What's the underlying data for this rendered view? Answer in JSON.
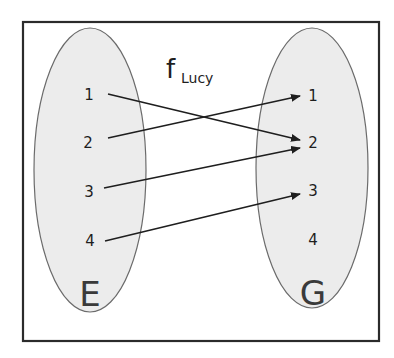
{
  "diagram": {
    "type": "function-mapping",
    "function": {
      "name": "f",
      "subscript": "Lucy"
    },
    "domain": {
      "label": "E",
      "elements": [
        "1",
        "2",
        "3",
        "4"
      ]
    },
    "codomain": {
      "label": "G",
      "elements": [
        "1",
        "2",
        "3",
        "4"
      ]
    },
    "mappings": [
      {
        "from": "1",
        "to": "2"
      },
      {
        "from": "2",
        "to": "1"
      },
      {
        "from": "3",
        "to": "2"
      },
      {
        "from": "4",
        "to": "3"
      }
    ],
    "colors": {
      "frame": "#2b2b2b",
      "set_fill": "#ececec",
      "set_stroke": "#6b6b6b",
      "arrow": "#1e1e1e",
      "text": "#1e1e1e"
    }
  }
}
